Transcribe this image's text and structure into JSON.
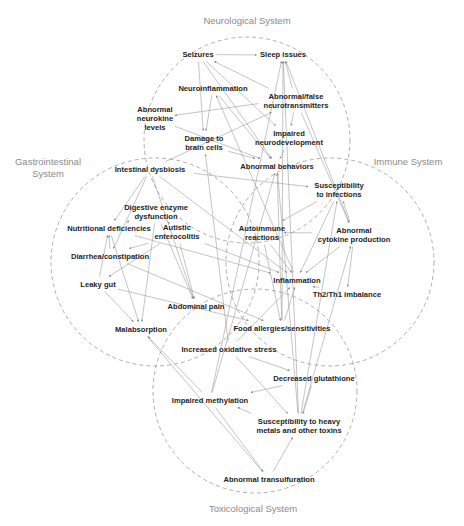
{
  "systems": [
    {
      "id": "neuro",
      "label": [
        "Neurological System"
      ],
      "cx": 247,
      "cy": 140,
      "r": 103,
      "lx": 247,
      "ly": 24
    },
    {
      "id": "gi",
      "label": [
        "Gastrointestinal",
        "System"
      ],
      "cx": 155,
      "cy": 262,
      "r": 104,
      "lx": 48,
      "ly": 165
    },
    {
      "id": "immune",
      "label": [
        "Immune System"
      ],
      "cx": 330,
      "cy": 262,
      "r": 104,
      "lx": 408,
      "ly": 165
    },
    {
      "id": "tox",
      "label": [
        "Toxicological System"
      ],
      "cx": 255,
      "cy": 391,
      "r": 102,
      "lx": 253,
      "ly": 512
    }
  ],
  "nodes": [
    {
      "id": "seizures",
      "lines": [
        "Seizures"
      ],
      "x": 198,
      "y": 57
    },
    {
      "id": "sleep",
      "lines": [
        "Sleep issues"
      ],
      "x": 283,
      "y": 57
    },
    {
      "id": "neuroinflam",
      "lines": [
        "Neuroinflammation"
      ],
      "x": 213,
      "y": 91
    },
    {
      "id": "abn_neurotrans",
      "lines": [
        "Abnormal/false",
        "neurotransmitters"
      ],
      "x": 296,
      "y": 99
    },
    {
      "id": "abn_neurokine",
      "lines": [
        "Abnormal",
        "neurokine",
        "levels"
      ],
      "x": 155,
      "y": 112
    },
    {
      "id": "damage_brain",
      "lines": [
        "Damage to",
        "brain cells"
      ],
      "x": 204,
      "y": 141
    },
    {
      "id": "impaired_neurodev",
      "lines": [
        "Impaired",
        "neurodevelopment"
      ],
      "x": 289,
      "y": 136
    },
    {
      "id": "abn_behaviors",
      "lines": [
        "Abnormal behaviors"
      ],
      "x": 277,
      "y": 169
    },
    {
      "id": "intest_dysbiosis",
      "lines": [
        "Intestinal dysbiosis"
      ],
      "x": 150,
      "y": 172
    },
    {
      "id": "suscept_infect",
      "lines": [
        "Susceptibility",
        "to infections"
      ],
      "x": 339,
      "y": 188
    },
    {
      "id": "dig_enzyme",
      "lines": [
        "Digestive enzyme",
        "dysfunction"
      ],
      "x": 156,
      "y": 210
    },
    {
      "id": "nutr_def",
      "lines": [
        "Nutritional deficiencies"
      ],
      "x": 109,
      "y": 231
    },
    {
      "id": "autoimmune",
      "lines": [
        "Autoimmune",
        "reactions"
      ],
      "x": 262,
      "y": 231
    },
    {
      "id": "abn_cytokine",
      "lines": [
        "Abnormal",
        "cytokine production"
      ],
      "x": 354,
      "y": 233
    },
    {
      "id": "autistic_ent",
      "lines": [
        "Autistic",
        "enterocolitis"
      ],
      "x": 177,
      "y": 230
    },
    {
      "id": "diarrhea",
      "lines": [
        "Diarrhea/constipation"
      ],
      "x": 110,
      "y": 259
    },
    {
      "id": "leaky_gut",
      "lines": [
        "Leaky gut"
      ],
      "x": 98,
      "y": 287
    },
    {
      "id": "inflammation",
      "lines": [
        "Inflammation"
      ],
      "x": 297,
      "y": 283
    },
    {
      "id": "th2th1",
      "lines": [
        "Th2/Th1 imbalance"
      ],
      "x": 347,
      "y": 297
    },
    {
      "id": "abd_pain",
      "lines": [
        "Abdominal pain"
      ],
      "x": 196,
      "y": 309
    },
    {
      "id": "food_allergies",
      "lines": [
        "Food allergies/sensitivities"
      ],
      "x": 282,
      "y": 331
    },
    {
      "id": "malabsorption",
      "lines": [
        "Malabsorption"
      ],
      "x": 141,
      "y": 332
    },
    {
      "id": "ox_stress",
      "lines": [
        "Increased oxidative stress"
      ],
      "x": 229,
      "y": 352
    },
    {
      "id": "glutathione",
      "lines": [
        "Decreased glutathione"
      ],
      "x": 314,
      "y": 381
    },
    {
      "id": "impaired_methyl",
      "lines": [
        "Impaired methylation"
      ],
      "x": 210,
      "y": 403
    },
    {
      "id": "heavy_metals",
      "lines": [
        "Susceptibility to heavy",
        "metals and other toxins"
      ],
      "x": 299,
      "y": 424
    },
    {
      "id": "transsulf",
      "lines": [
        "Abnormal transulfuration"
      ],
      "x": 269,
      "y": 482
    }
  ],
  "edges": [
    [
      [
        "seizures"
      ],
      [
        "sleep"
      ]
    ],
    [
      [
        "seizures"
      ],
      [
        "abn_behaviors"
      ]
    ],
    [
      [
        "seizures"
      ],
      [
        "damage_brain"
      ]
    ],
    [
      [
        "seizures"
      ],
      [
        "impaired_neurodev"
      ]
    ],
    [
      [
        "abn_neurotrans"
      ],
      [
        "seizures"
      ]
    ],
    [
      [
        "abn_neurotrans"
      ],
      [
        "sleep"
      ]
    ],
    [
      [
        "abn_neurotrans"
      ],
      [
        "impaired_neurodev"
      ]
    ],
    [
      [
        "abn_neurotrans"
      ],
      [
        "abn_neurokine"
      ]
    ],
    [
      [
        "neuroinflam"
      ],
      [
        "damage_brain"
      ]
    ],
    [
      [
        "neuroinflam"
      ],
      [
        "abn_behaviors"
      ]
    ],
    [
      [
        "abn_neurokine"
      ],
      [
        "abn_behaviors"
      ]
    ],
    [
      [
        "damage_brain"
      ],
      [
        "abn_behaviors"
      ]
    ],
    [
      [
        "impaired_neurodev"
      ],
      [
        "abn_behaviors"
      ]
    ],
    [
      [
        "intest_dysbiosis"
      ],
      [
        "abn_neurotrans"
      ]
    ],
    [
      [
        "intest_dysbiosis"
      ],
      [
        "nutr_def"
      ]
    ],
    [
      [
        "intest_dysbiosis"
      ],
      [
        "diarrhea"
      ]
    ],
    [
      [
        "intest_dysbiosis"
      ],
      [
        "abd_pain"
      ]
    ],
    [
      [
        "intest_dysbiosis"
      ],
      [
        "suscept_infect"
      ]
    ],
    [
      [
        "intest_dysbiosis"
      ],
      [
        "inflammation"
      ]
    ],
    [
      [
        "dig_enzyme"
      ],
      [
        "nutr_def"
      ]
    ],
    [
      [
        "dig_enzyme"
      ],
      [
        "malabsorption"
      ]
    ],
    [
      [
        "dig_enzyme"
      ],
      [
        "abd_pain"
      ]
    ],
    [
      [
        "autistic_ent"
      ],
      [
        "dig_enzyme"
      ]
    ],
    [
      [
        "autistic_ent"
      ],
      [
        "diarrhea"
      ]
    ],
    [
      [
        "autistic_ent"
      ],
      [
        "leaky_gut"
      ]
    ],
    [
      [
        "autistic_ent"
      ],
      [
        "abd_pain"
      ]
    ],
    [
      [
        "autistic_ent"
      ],
      [
        "inflammation"
      ]
    ],
    [
      [
        "diarrhea"
      ],
      [
        "nutr_def"
      ]
    ],
    [
      [
        "leaky_gut"
      ],
      [
        "nutr_def"
      ]
    ],
    [
      [
        "leaky_gut"
      ],
      [
        "malabsorption"
      ]
    ],
    [
      [
        "leaky_gut"
      ],
      [
        "food_allergies"
      ]
    ],
    [
      [
        "nutr_def"
      ],
      [
        "malabsorption"
      ]
    ],
    [
      [
        "nutr_def"
      ],
      [
        "inflammation"
      ]
    ],
    [
      [
        "diarrhea"
      ],
      [
        "food_allergies"
      ]
    ],
    [
      [
        "malabsorption"
      ],
      [
        "transsulf"
      ]
    ],
    [
      [
        "abn_cytokine"
      ],
      [
        "autoimmune"
      ]
    ],
    [
      [
        "abn_cytokine"
      ],
      [
        "suscept_infect"
      ]
    ],
    [
      [
        "abn_cytokine"
      ],
      [
        "th2th1"
      ]
    ],
    [
      [
        "abn_cytokine"
      ],
      [
        "inflammation"
      ]
    ],
    [
      [
        "abn_cytokine"
      ],
      [
        "sleep"
      ]
    ],
    [
      [
        "suscept_infect"
      ],
      [
        "autoimmune"
      ]
    ],
    [
      [
        "suscept_infect"
      ],
      [
        "inflammation"
      ]
    ],
    [
      [
        "autoimmune"
      ],
      [
        "inflammation"
      ]
    ],
    [
      [
        "autoimmune"
      ],
      [
        "food_allergies"
      ]
    ],
    [
      [
        "inflammation"
      ],
      [
        "th2th1"
      ]
    ],
    [
      [
        "inflammation"
      ],
      [
        "neuroinflam"
      ]
    ],
    [
      [
        "food_allergies"
      ],
      [
        "inflammation"
      ]
    ],
    [
      [
        "food_allergies"
      ],
      [
        "abn_behaviors"
      ]
    ],
    [
      [
        "food_allergies"
      ],
      [
        "sleep"
      ]
    ],
    [
      [
        "ox_stress"
      ],
      [
        "glutathione"
      ]
    ],
    [
      [
        "ox_stress"
      ],
      [
        "inflammation"
      ]
    ],
    [
      [
        "ox_stress"
      ],
      [
        "damage_brain"
      ]
    ],
    [
      [
        "ox_stress"
      ],
      [
        "heavy_metals"
      ]
    ],
    [
      [
        "glutathione"
      ],
      [
        "impaired_methyl"
      ]
    ],
    [
      [
        "glutathione"
      ],
      [
        "heavy_metals"
      ]
    ],
    [
      [
        "impaired_methyl"
      ],
      [
        "transsulf"
      ]
    ],
    [
      [
        "impaired_methyl"
      ],
      [
        "sleep"
      ]
    ],
    [
      [
        "impaired_methyl"
      ],
      [
        "abn_behaviors"
      ]
    ],
    [
      [
        "heavy_metals"
      ],
      [
        "impaired_methyl"
      ]
    ],
    [
      [
        "heavy_metals"
      ],
      [
        "sleep"
      ]
    ],
    [
      [
        "heavy_metals"
      ],
      [
        "abn_behaviors"
      ]
    ],
    [
      [
        "heavy_metals"
      ],
      [
        "suscept_infect"
      ]
    ],
    [
      [
        "heavy_metals"
      ],
      [
        "abn_cytokine"
      ]
    ],
    [
      [
        "transsulf"
      ],
      [
        "heavy_metals"
      ]
    ],
    [
      [
        "impaired_methyl"
      ],
      [
        "malabsorption"
      ]
    ],
    [
      [
        "abn_neurotrans"
      ],
      [
        "abn_cytokine"
      ]
    ]
  ]
}
